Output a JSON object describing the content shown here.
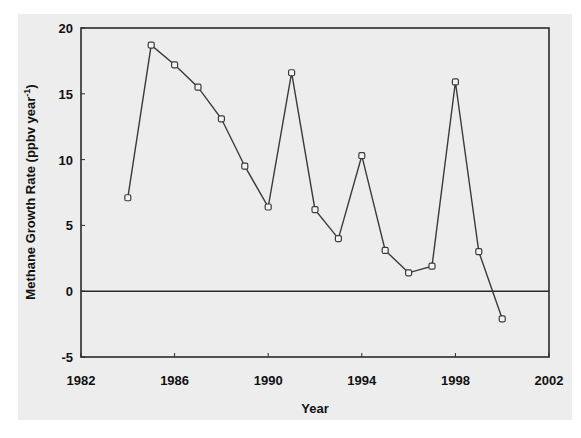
{
  "chart_data": {
    "type": "line",
    "title": "",
    "xlabel": "Year",
    "ylabel": "Methane Growth Rate (ppbv year-1)",
    "ylabel_main": "Methane Growth Rate (ppbv year",
    "ylabel_sup": "-1",
    "ylabel_close": ")",
    "xlim": [
      1982,
      2002
    ],
    "ylim": [
      -5,
      20
    ],
    "xticks": [
      1982,
      1986,
      1990,
      1994,
      1998,
      2002
    ],
    "yticks": [
      -5,
      0,
      5,
      10,
      15,
      20
    ],
    "grid": false,
    "zero_line": true,
    "legend": null,
    "marker": "open-square",
    "x": [
      1984,
      1985,
      1986,
      1987,
      1988,
      1989,
      1990,
      1991,
      1992,
      1993,
      1994,
      1995,
      1996,
      1997,
      1998,
      1999,
      2000
    ],
    "series": [
      {
        "name": "Methane Growth Rate",
        "values": [
          7.1,
          18.7,
          17.2,
          15.5,
          13.1,
          9.5,
          6.4,
          16.6,
          6.2,
          4.0,
          10.3,
          3.1,
          1.4,
          1.9,
          15.9,
          3.0,
          -2.1
        ]
      }
    ]
  },
  "style": {
    "line_color": "#3a3a3a",
    "axis_color": "#2a2a2a",
    "background": "#ededed"
  }
}
